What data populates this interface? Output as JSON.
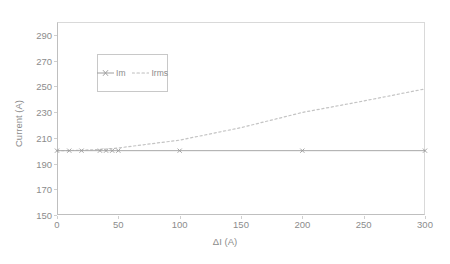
{
  "chart_data": {
    "type": "line",
    "title": "",
    "xlabel": "ΔI (A)",
    "ylabel": "Current (A)",
    "xlim": [
      0,
      300
    ],
    "ylim": [
      150,
      300
    ],
    "xticks": [
      0,
      50,
      100,
      150,
      200,
      250,
      300
    ],
    "xtick_labels": [
      "0",
      "50",
      "100",
      "150",
      "200",
      "250",
      "300"
    ],
    "yticks": [
      150,
      170,
      190,
      210,
      230,
      250,
      270,
      290
    ],
    "ytick_labels": [
      "150",
      "170",
      "190",
      "210",
      "230",
      "250",
      "270",
      "290"
    ],
    "grid": false,
    "legend_position": "upper-left-inside",
    "series": [
      {
        "name": "Im",
        "style": "solid-with-markers",
        "color": "#a0a0a0",
        "marker": "cross",
        "x": [
          0,
          10,
          20,
          35,
          40,
          45,
          50,
          100,
          200,
          300
        ],
        "values": [
          200,
          200,
          200,
          200,
          200,
          200,
          200,
          200,
          200,
          200
        ]
      },
      {
        "name": "Irms",
        "style": "dotted",
        "color": "#bdbdbd",
        "marker": "none",
        "x": [
          0,
          10,
          20,
          35,
          40,
          45,
          50,
          100,
          150,
          200,
          250,
          300
        ],
        "values": [
          200.0,
          200.1,
          200.3,
          201.0,
          201.3,
          201.7,
          202.1,
          208.2,
          217.9,
          229.7,
          238.6,
          248.0
        ]
      }
    ]
  },
  "legend": {
    "entries": [
      {
        "label": "Im",
        "style": "solid",
        "marker": "cross",
        "color": "#9e9e9e"
      },
      {
        "label": "Irms",
        "style": "dotted",
        "marker": "none",
        "color": "#bdbdbd"
      }
    ]
  },
  "axes": {
    "x_title": "ΔI (A)",
    "y_title": "Current (A)"
  }
}
